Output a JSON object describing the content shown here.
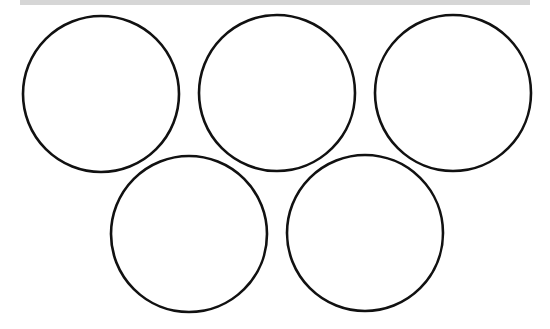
{
  "top_bar": {
    "color": "#d6d6d6"
  },
  "rings": {
    "stroke_color": "#111111",
    "stroke_width": 2.6,
    "fill": "#ffffff",
    "items": [
      {
        "name": "ring-top-left",
        "cx": 101,
        "cy": 94,
        "r": 78
      },
      {
        "name": "ring-top-middle",
        "cx": 277,
        "cy": 93,
        "r": 78
      },
      {
        "name": "ring-top-right",
        "cx": 453,
        "cy": 93,
        "r": 78
      },
      {
        "name": "ring-bottom-left",
        "cx": 189,
        "cy": 234,
        "r": 78
      },
      {
        "name": "ring-bottom-right",
        "cx": 365,
        "cy": 233,
        "r": 78
      }
    ]
  }
}
